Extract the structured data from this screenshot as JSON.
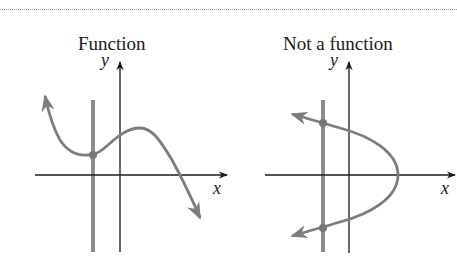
{
  "figure": {
    "topic": "Vertical line test",
    "colors": {
      "axis": "#1a1a1a",
      "curve": "#7d7d7d",
      "test_line": "#8c8c8c",
      "point": "#777777",
      "rule": "#9a9a9a"
    },
    "panels": [
      {
        "title": "Function",
        "x_label": "x",
        "y_label": "y",
        "curve_type": "cubic-like curve",
        "intersections_with_vertical_line": 1
      },
      {
        "title": "Not a function",
        "x_label": "x",
        "y_label": "y",
        "curve_type": "sideways parabola opening left",
        "intersections_with_vertical_line": 2
      }
    ]
  }
}
